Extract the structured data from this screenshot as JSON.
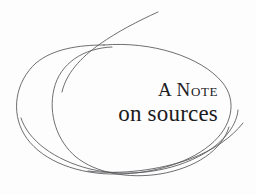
{
  "page": {
    "background_color": "#fdfdfd",
    "width": 256,
    "height": 195
  },
  "heading": {
    "line_one": "A Note",
    "line_two": "on sources",
    "full_text": "A Note on sources",
    "text_color": "#1b1b1d",
    "style": "small-caps-first-line"
  },
  "ornament": {
    "name": "hand-drawn-ellipse-scribble",
    "stroke_color": "#555558",
    "stroke_width": 0.85,
    "shapes": [
      {
        "name": "outer-ellipse",
        "cx": 125,
        "cy": 104,
        "rx": 108,
        "ry": 60,
        "rotation": -2
      },
      {
        "name": "inner-ellipse",
        "cx": 100,
        "cy": 110,
        "rx": 48,
        "ry": 58,
        "rotation": 4
      },
      {
        "name": "upper-right-tail",
        "end_x": 158,
        "end_y": 12
      },
      {
        "name": "lower-right-tail",
        "end_x": 243,
        "end_y": 123
      }
    ]
  }
}
